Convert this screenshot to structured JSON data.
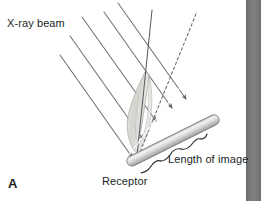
{
  "figure": {
    "panel_label": "A",
    "labels": {
      "xray_beam": "X-ray beam",
      "receptor": "Receptor",
      "length_of_image": "Length of image"
    },
    "colors": {
      "background": "#ffffff",
      "text": "#211f1f",
      "beam_line": "#6f6f78",
      "receptor_body": "#c9c9c9",
      "receptor_highlight": "#f2f2f2",
      "receptor_outline": "#7a7a7a",
      "object_fill": "#d8d8d4",
      "object_outline": "#a2a29c",
      "scan_edge": "#6a6a6a"
    },
    "elements": {
      "beam_count": 5,
      "dashed_ray": "projection-ray",
      "bracket": "length-of-image-bracket",
      "object": "tooth-object",
      "receptor": "receptor-bar"
    }
  }
}
